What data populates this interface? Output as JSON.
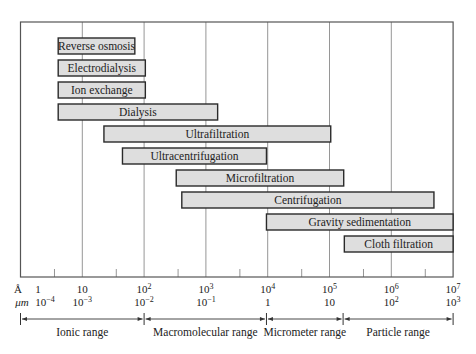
{
  "chart_data": {
    "type": "bar",
    "orientation": "horizontal-range",
    "title": "",
    "xlabel": "Particle size",
    "x_scale": "log10",
    "x_units_primary": "Å",
    "x_units_secondary": "μm",
    "xlim_angstrom": [
      1,
      10000000
    ],
    "grid": "vertical",
    "bars": [
      {
        "name": "Reverse osmosis",
        "log_start": 0.61,
        "log_end": 1.85
      },
      {
        "name": "Electrodialysis",
        "log_start": 0.61,
        "log_end": 2.02
      },
      {
        "name": "Ion exchange",
        "log_start": 0.61,
        "log_end": 2.02
      },
      {
        "name": "Dialysis",
        "log_start": 0.61,
        "log_end": 3.19
      },
      {
        "name": "Ultrafiltration",
        "log_start": 1.35,
        "log_end": 5.02
      },
      {
        "name": "Ultracentrifugation",
        "log_start": 1.65,
        "log_end": 3.98
      },
      {
        "name": "Microfiltration",
        "log_start": 2.52,
        "log_end": 5.23
      },
      {
        "name": "Centrifugation",
        "log_start": 2.61,
        "log_end": 6.69
      },
      {
        "name": "Gravity sedimentation",
        "log_start": 3.98,
        "log_end": 7.0
      },
      {
        "name": "Cloth filtration",
        "log_start": 5.24,
        "log_end": 7.0
      }
    ],
    "axis": {
      "row1_unit": "Å",
      "row2_unit": "μm",
      "ticks": [
        {
          "log": 0,
          "angstrom": "1",
          "angstrom_sup": "",
          "micron": "10",
          "micron_sup": "−4"
        },
        {
          "log": 1,
          "angstrom": "10",
          "angstrom_sup": "",
          "micron": "10",
          "micron_sup": "−3"
        },
        {
          "log": 2,
          "angstrom": "10",
          "angstrom_sup": "2",
          "micron": "10",
          "micron_sup": "−2"
        },
        {
          "log": 3,
          "angstrom": "10",
          "angstrom_sup": "3",
          "micron": "10",
          "micron_sup": "−1"
        },
        {
          "log": 4,
          "angstrom": "10",
          "angstrom_sup": "4",
          "micron": "1",
          "micron_sup": ""
        },
        {
          "log": 5,
          "angstrom": "10",
          "angstrom_sup": "5",
          "micron": "10",
          "micron_sup": ""
        },
        {
          "log": 6,
          "angstrom": "10",
          "angstrom_sup": "6",
          "micron": "10",
          "micron_sup": "2"
        },
        {
          "log": 7,
          "angstrom": "10",
          "angstrom_sup": "7",
          "micron": "10",
          "micron_sup": "3"
        }
      ]
    },
    "ranges": [
      {
        "name": "Ionic range",
        "log_start": 0,
        "log_end": 2.0
      },
      {
        "name": "Macromolecular range",
        "log_start": 2.0,
        "log_end": 3.98
      },
      {
        "name": "Micrometer range",
        "log_start": 3.98,
        "log_end": 5.22
      },
      {
        "name": "Particle range",
        "log_start": 5.22,
        "log_end": 7.0
      }
    ]
  },
  "colors": {
    "bar_fill": "#dedede",
    "bar_stroke": "#2a2a2a",
    "grid": "#8a8a8a",
    "frame": "#555555",
    "text": "#222222"
  }
}
